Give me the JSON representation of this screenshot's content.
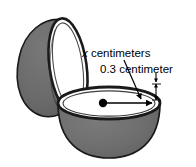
{
  "figure": {
    "type": "geometry-diagram",
    "labels": {
      "radius_variable": "x",
      "radius_units": " centimeters",
      "radius_full": "x centimeters",
      "thickness_full": "0.3 centimeter",
      "thickness_value": "0.3",
      "thickness_units": " centimeter"
    },
    "colors": {
      "shell_gray": "#6e6e6e",
      "shell_gray_dark": "#5f5f5f",
      "outline": "#1a1a1a",
      "interior_white": "#ffffff",
      "background": "#ffffff",
      "text": "#000000"
    },
    "annotations": {
      "center_dot": "center of bowl opening",
      "radius_arrow": "arrow from center to rim indicating radius x",
      "thickness_arrow": "double arrow at rim indicating wall thickness 0.3"
    }
  }
}
